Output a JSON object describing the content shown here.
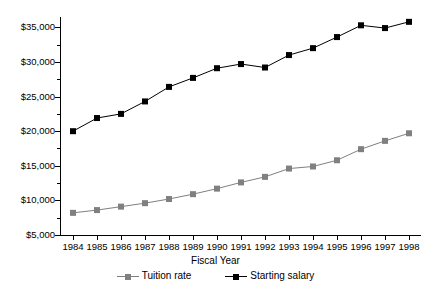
{
  "chart_data": {
    "type": "line",
    "title": "",
    "xlabel": "Fiscal Year",
    "ylabel": "",
    "categories": [
      "1984",
      "1985",
      "1986",
      "1987",
      "1988",
      "1989",
      "1990",
      "1991",
      "1992",
      "1993",
      "1994",
      "1995",
      "1996",
      "1997",
      "1998"
    ],
    "ylim": [
      5000,
      36500
    ],
    "yticks": [
      5000,
      10000,
      15000,
      20000,
      25000,
      30000,
      35000
    ],
    "ytick_labels": [
      "$5,000",
      "$10,000",
      "$15,000",
      "$20,000",
      "$25,000",
      "$30,000",
      "$35,000"
    ],
    "grid": false,
    "legend_position": "bottom",
    "series": [
      {
        "name": "Tuition rate",
        "color": "#808080",
        "marker": "square",
        "values": [
          8200,
          8600,
          9100,
          9600,
          10200,
          10900,
          11700,
          12600,
          13400,
          14600,
          14900,
          15800,
          17400,
          18600,
          19700
        ]
      },
      {
        "name": "Starting salary",
        "color": "#000000",
        "marker": "square",
        "values": [
          20000,
          21900,
          22500,
          24300,
          26400,
          27700,
          29100,
          29700,
          29200,
          31000,
          32000,
          33600,
          35300,
          34900,
          35800
        ]
      }
    ]
  },
  "axis": {
    "x_title": "Fiscal Year"
  },
  "legend": {
    "items": [
      {
        "label": "Tuition rate"
      },
      {
        "label": "Starting salary"
      }
    ]
  },
  "colors": {
    "tuition": "#808080",
    "salary": "#000000",
    "axis": "#000000",
    "background": "#ffffff"
  }
}
